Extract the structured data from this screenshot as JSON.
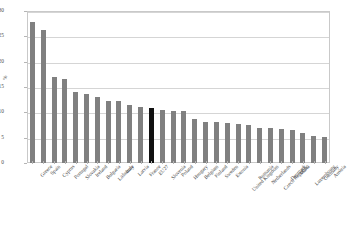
{
  "chart_data": {
    "type": "bar",
    "title": "",
    "xlabel": "",
    "ylabel": "%",
    "ylim": [
      0,
      30
    ],
    "yticks": [
      0,
      5,
      10,
      15,
      20,
      25,
      30
    ],
    "grid": true,
    "legend": "none",
    "highlight_category": "EU27",
    "colors": {
      "bar": "#808080",
      "highlight": "#111111",
      "grid": "#d5d5d5",
      "frame": "#c9c9c9",
      "text": "#3f3f3f"
    },
    "categories": [
      "Greece",
      "Spain",
      "Cyprus",
      "Portugal",
      "Slovakia",
      "Ireland",
      "Bulgaria",
      "Lithuania",
      "Italy",
      "Latvia",
      "France",
      "EU27",
      "Slovenia",
      "Poland",
      "Hungary",
      "Belgium",
      "Finland",
      "Sweden",
      "Estonia",
      "United Kingdom",
      "Romania",
      "Netherlands",
      "Czech Republic",
      "Denmark",
      "Malta",
      "Luxembourg",
      "Germany",
      "Austria"
    ],
    "values": [
      27.9,
      26.2,
      16.9,
      16.5,
      14.0,
      13.6,
      13.0,
      12.3,
      12.2,
      11.4,
      11.1,
      10.9,
      10.4,
      10.3,
      10.2,
      8.7,
      8.0,
      8.1,
      7.9,
      7.7,
      7.6,
      7.0,
      6.9,
      6.8,
      6.5,
      5.9,
      5.3,
      5.2
    ]
  }
}
